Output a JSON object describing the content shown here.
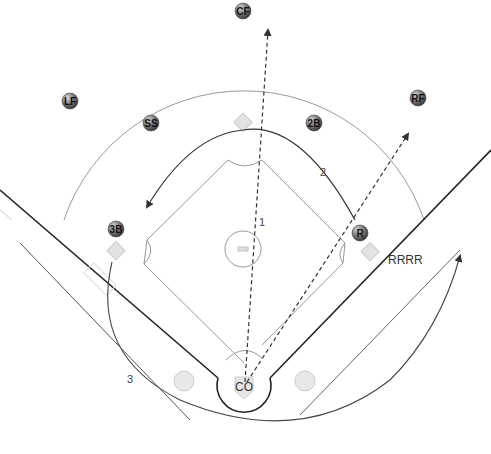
{
  "diagram": {
    "type": "baseball-field-play",
    "players": [
      {
        "id": "cf",
        "label": "CF",
        "x": 243,
        "y": 11
      },
      {
        "id": "lf",
        "label": "LF",
        "x": 70,
        "y": 101
      },
      {
        "id": "ss",
        "label": "SS",
        "x": 151,
        "y": 123
      },
      {
        "id": "2b",
        "label": "2B",
        "x": 314,
        "y": 123
      },
      {
        "id": "rf",
        "label": "RF",
        "x": 418,
        "y": 98
      },
      {
        "id": "3b",
        "label": "3B",
        "x": 116,
        "y": 229
      },
      {
        "id": "r",
        "label": "R",
        "x": 360,
        "y": 233
      }
    ],
    "home": {
      "label": "CO",
      "x": 244,
      "y": 387
    },
    "annotations": [
      {
        "id": "path-1",
        "label": "1",
        "x": 262,
        "y": 222
      },
      {
        "id": "path-2",
        "label": "2",
        "x": 324,
        "y": 173
      },
      {
        "id": "path-3",
        "label": "3",
        "x": 131,
        "y": 379
      },
      {
        "id": "runner-path",
        "label": "RRRR",
        "x": 388,
        "y": 260
      }
    ],
    "colors": {
      "player_ball": "#6e6e6e",
      "base": "#e0e0e0",
      "line_dark": "#222222",
      "line_light": "#bbbbbb",
      "arc": "#888888"
    }
  }
}
